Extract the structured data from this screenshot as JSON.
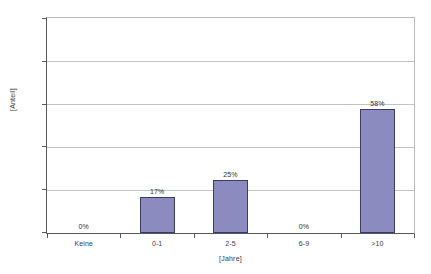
{
  "clipped_caption": "",
  "chart_data": {
    "type": "bar",
    "title": "",
    "xlabel": "[Jahre]",
    "ylabel": "[Anteil]",
    "categories": [
      "Keine",
      "0-1",
      "2-5",
      "6-9",
      ">10"
    ],
    "values": [
      0,
      17,
      25,
      0,
      58
    ],
    "data_labels": [
      "0%",
      "17%",
      "25%",
      "0%",
      "58%"
    ],
    "ylim": [
      0,
      100
    ],
    "ytick_values": [
      0,
      20,
      40,
      60,
      80,
      100
    ],
    "ytick_labels": [
      "0%",
      "20%",
      "40%",
      "60%",
      "80%",
      "100%"
    ],
    "grid": "horizontal",
    "legend": "none",
    "bar_color": "#8b8bc0",
    "bar_border_color": "#3b3b66",
    "gridline_color": "#c3c3c7",
    "axis_color": "#58585f"
  }
}
